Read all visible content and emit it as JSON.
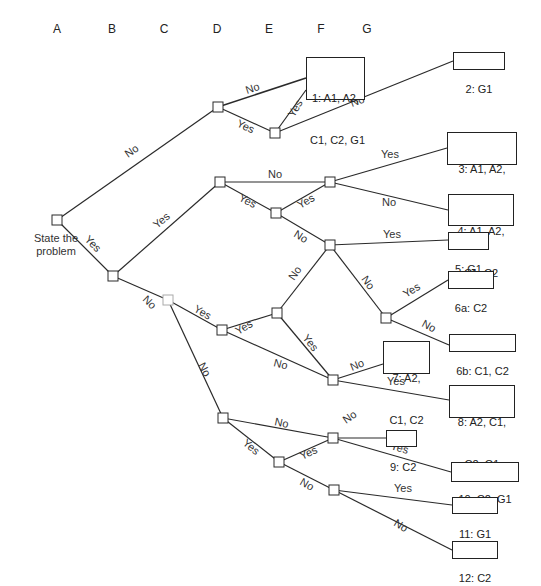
{
  "columns": [
    "A",
    "B",
    "C",
    "D",
    "E",
    "F",
    "G"
  ],
  "root": {
    "label_line1": "State the",
    "label_line2": "problem"
  },
  "edge_labels": {
    "yes": "Yes",
    "no": "No"
  },
  "leaves": [
    {
      "id": "1",
      "line1": "1: A1, A2,",
      "line2": "C1, C2, G1"
    },
    {
      "id": "2",
      "line1": "2: G1"
    },
    {
      "id": "3",
      "line1": "3: A1, A2,",
      "line2": "C1, C2, G1"
    },
    {
      "id": "4",
      "line1": "4: A1, A2,",
      "line2": "C1, C2"
    },
    {
      "id": "5",
      "line1": "5: G1"
    },
    {
      "id": "6a",
      "line1": "6a: C2"
    },
    {
      "id": "6b",
      "line1": "6b: C1, C2"
    },
    {
      "id": "7",
      "line1": "7: A2,",
      "line2": "C1, C2"
    },
    {
      "id": "8",
      "line1": "8: A2, C1,",
      "line2": "C2, G1"
    },
    {
      "id": "9",
      "line1": "9: C2"
    },
    {
      "id": "10",
      "line1": "10: C2, G1"
    },
    {
      "id": "11",
      "line1": "11: G1"
    },
    {
      "id": "12",
      "line1": "12: C2"
    }
  ]
}
